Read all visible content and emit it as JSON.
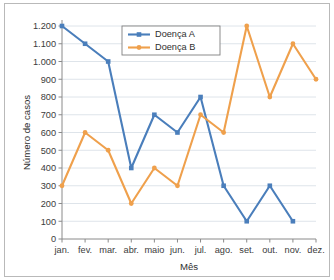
{
  "chart_data": {
    "type": "line",
    "title": "",
    "xlabel": "Mês",
    "ylabel": "Número de casos",
    "categories": [
      "jan.",
      "fev.",
      "mar.",
      "abr.",
      "maio",
      "jun.",
      "jul.",
      "ago.",
      "set.",
      "out.",
      "nov.",
      "dez."
    ],
    "ylim": [
      0,
      1200
    ],
    "ytick_step": 100,
    "ytick_labels": [
      "0",
      "100",
      "200",
      "300",
      "400",
      "500",
      "600",
      "700",
      "800",
      "900",
      "1.000",
      "1.100",
      "1.200"
    ],
    "ytick_values": [
      0,
      100,
      200,
      300,
      400,
      500,
      600,
      700,
      800,
      900,
      1000,
      1100,
      1200
    ],
    "grid": true,
    "legend_position": "top-center",
    "series": [
      {
        "name": "Doença A",
        "color": "#4A7EBB",
        "marker": "square",
        "values": [
          1200,
          1100,
          1000,
          400,
          700,
          600,
          800,
          300,
          100,
          300,
          100,
          null
        ]
      },
      {
        "name": "Doença B",
        "color": "#EFA04C",
        "marker": "circle",
        "values": [
          300,
          600,
          500,
          200,
          400,
          300,
          700,
          600,
          1200,
          800,
          1100,
          900
        ]
      }
    ]
  },
  "colors": {
    "series_a": "#4A7EBB",
    "series_b": "#EFA04C",
    "grid": "#d6dde5",
    "axis": "#8a8a8a",
    "text": "#2f2f2f",
    "frame": "#b9b9b9"
  }
}
